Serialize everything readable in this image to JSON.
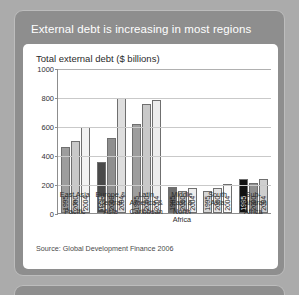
{
  "panel": {
    "title": "External debt is increasing in most regions"
  },
  "card": {
    "source": "Source: Global Development Finance 2006"
  },
  "chart_data": {
    "type": "bar",
    "title": "Total external debt ($ billions)",
    "xlabel": "",
    "ylabel": "",
    "ylim": [
      0,
      1000
    ],
    "yticks": [
      0,
      200,
      400,
      600,
      800,
      1000
    ],
    "ytick_labels": [
      "0",
      "200",
      "400",
      "600",
      "800",
      "1000"
    ],
    "grid": true,
    "legend": "none",
    "categories": [
      "East Asia & Pacific",
      "Europe & Central Asia",
      "Latin America & Caribbean",
      "Middle East & North Africa",
      "South Asia",
      "Sub-Saharan Africa"
    ],
    "category_lines": [
      [
        "East Asia &",
        "Pacific"
      ],
      [
        "Europe &",
        "Central",
        "Asia"
      ],
      [
        "Latin",
        "America &",
        "Caribbean"
      ],
      [
        "Middle East &",
        "North",
        "Africa"
      ],
      [
        "South",
        "Asia"
      ],
      [
        "Sub-",
        "Saharan",
        "Africa"
      ]
    ],
    "series": [
      {
        "name": "1995",
        "values": [
          455,
          350,
          615,
          180,
          155,
          235
        ],
        "color": "#808080"
      },
      {
        "name": "2000",
        "values": [
          500,
          515,
          755,
          155,
          170,
          210
        ],
        "color": "#b5b5b5"
      },
      {
        "name": "2004",
        "values": [
          590,
          790,
          780,
          175,
          200,
          235
        ],
        "color": "#e8e8e8"
      }
    ],
    "bar_colors": {
      "east-asia-pacific": [
        "#9d9d9d",
        "#c9c9c9",
        "#f2f2f2"
      ],
      "europe-central-asia": [
        "#4a4a4a",
        "#8f8f8f",
        "#dedede"
      ],
      "latin-america-caribbean": [
        "#9d9d9d",
        "#c9c9c9",
        "#ededed"
      ],
      "middle-east-north-africa": [
        "#6e6e6e",
        "#bdbdbd",
        "#ededed"
      ],
      "south-asia": [
        "#d6d6d6",
        "#e4e4e4",
        "#fafafa"
      ],
      "sub-saharan-africa": [
        "#121212",
        "#8f8f8f",
        "#cfcfcf"
      ]
    }
  }
}
